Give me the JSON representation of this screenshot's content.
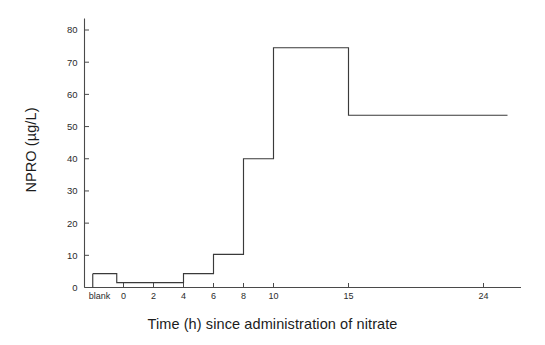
{
  "chart_data": {
    "type": "line",
    "line_style": "step-post",
    "title": "",
    "subtitle": "",
    "xlabel": "Time (h) since administration of nitrate",
    "ylabel": "NPRO (µg/L)",
    "categories": [
      "blank",
      "0",
      "2",
      "4",
      "6",
      "8",
      "10",
      "15",
      "24"
    ],
    "x_tick_labels": [
      "blank",
      "0",
      "2",
      "4",
      "6",
      "8",
      "10",
      "15",
      "24"
    ],
    "x_numeric_positions": [
      -1.6,
      0,
      2,
      4,
      6,
      8,
      10,
      15,
      24
    ],
    "values": [
      4.3,
      1.5,
      1.5,
      4.3,
      10.3,
      40.0,
      74.5,
      53.5,
      53.5
    ],
    "series": [
      {
        "name": "NPRO",
        "values": [
          4.3,
          1.5,
          1.5,
          4.3,
          10.3,
          40.0,
          74.5,
          53.5,
          53.5
        ]
      }
    ],
    "y_tick_labels": [
      "0",
      "10",
      "20",
      "30",
      "40",
      "50",
      "60",
      "70",
      "80"
    ],
    "y_ticks": [
      0,
      10,
      20,
      30,
      40,
      50,
      60,
      70,
      80
    ],
    "ylim": [
      0,
      85
    ],
    "xlim": [
      -2.6,
      26.5
    ],
    "grid": false,
    "legend": false,
    "legend_position": "none",
    "line_color": "#3a3a3a",
    "axis_color": "#4a4a4a",
    "background_color": "#ffffff",
    "annotations": []
  },
  "figure": {
    "axis_color": "#4a4a4a",
    "line_color": "#3a3a3a"
  }
}
